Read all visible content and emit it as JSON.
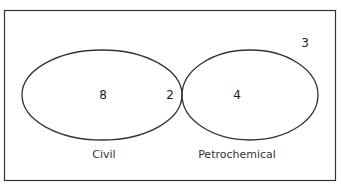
{
  "diagram": {
    "type": "venn",
    "sets": [
      {
        "name": "Civil",
        "only": "8"
      },
      {
        "name": "Petrochemical",
        "only": "4"
      }
    ],
    "intersection": "2",
    "outside": "3",
    "labels": {
      "civil": "Civil",
      "petrochemical": "Petrochemical"
    },
    "colors": {
      "stroke": "#333333",
      "background": "#ffffff"
    }
  }
}
